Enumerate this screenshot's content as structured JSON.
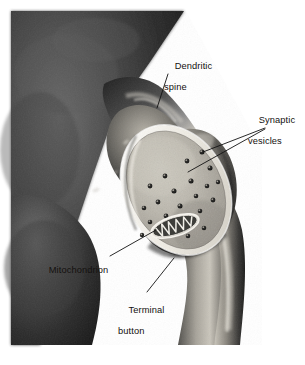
{
  "figure": {
    "kind": "anatomical-photograph-diagram",
    "width": 305,
    "height": 365,
    "background_color": "#ffffff",
    "photo_tone": "grayscale halftone"
  },
  "labels": {
    "dendritic_spine": {
      "line1": "Dendritic",
      "line2": "spine"
    },
    "synaptic_vesicles": {
      "line1": "Synaptic",
      "line2": "vesicles"
    },
    "mitochondrion": {
      "line1": "Mitochondrion",
      "line2": ""
    },
    "terminal_button": {
      "line1": "Terminal",
      "line2": "button"
    }
  },
  "colors": {
    "label_text": "#14110f",
    "leader_line": "#121212",
    "photo_dark": "#2a2a2a",
    "photo_mid": "#7d7d7d",
    "photo_light": "#d9d6cd",
    "cut_face": "#b9b5aa",
    "cut_face_rim": "#f3f1ea",
    "vesicle_dark": "#1b1b1b",
    "mitochondrion_body": "#efece4",
    "cristae_dark": "#141414"
  },
  "structures": [
    {
      "name": "dendrite-mass",
      "description": "Large dark dendritic trunk occupying the upper-left of the field"
    },
    {
      "name": "dendritic-spine",
      "description": "Rounded protrusion extending right from the dendrite toward the terminal"
    },
    {
      "name": "terminal-button",
      "description": "Bulbous axon ending, cut open to reveal its interior"
    },
    {
      "name": "cut-face",
      "description": "Pale elliptical sectioned face of the terminal button"
    },
    {
      "name": "axon",
      "description": "Axon curving down and to the right away from the terminal button"
    },
    {
      "name": "mitochondrion",
      "description": "Elongated organelle with dark zigzag cristae in the lower-left of the cut face"
    },
    {
      "name": "synaptic-vesicles",
      "description": "Scattered small dark round vesicles across the cut face"
    },
    {
      "name": "synaptic-cleft",
      "description": "Narrow bright gap separating the spine from the terminal button"
    }
  ],
  "vesicle_count": 21
}
